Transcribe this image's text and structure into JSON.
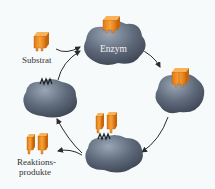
{
  "diagram": {
    "labels": {
      "substrate": "Substrat",
      "enzyme": "Enzym",
      "products_line1": "Reaktions-",
      "products_line2": "produkte"
    },
    "colors": {
      "background": "#f7fafb",
      "enzyme_fill": "#5e6878",
      "enzyme_highlight": "#8a95a6",
      "substrate_fill": "#f28c1e",
      "substrate_dark": "#c9660a",
      "arrow": "#333333"
    },
    "nodes": [
      {
        "id": "enzyme-free-top",
        "description": "Free enzyme with substrate approaching",
        "x": 120,
        "y": 45
      },
      {
        "id": "enzyme-substrate-complex",
        "description": "Enzyme-substrate complex",
        "x": 180,
        "y": 92
      },
      {
        "id": "enzyme-product-complex",
        "description": "Enzyme with split products",
        "x": 110,
        "y": 150
      },
      {
        "id": "enzyme-free-left",
        "description": "Free enzyme after product release",
        "x": 45,
        "y": 95
      }
    ],
    "arrows": [
      {
        "from": "substrate",
        "to": "enzyme-free-top"
      },
      {
        "from": "enzyme-free-left",
        "to": "enzyme-free-top"
      },
      {
        "from": "enzyme-free-top",
        "to": "enzyme-substrate-complex"
      },
      {
        "from": "enzyme-substrate-complex",
        "to": "enzyme-product-complex"
      },
      {
        "from": "enzyme-product-complex",
        "to": "products"
      },
      {
        "from": "enzyme-product-complex",
        "to": "enzyme-free-left"
      }
    ]
  }
}
